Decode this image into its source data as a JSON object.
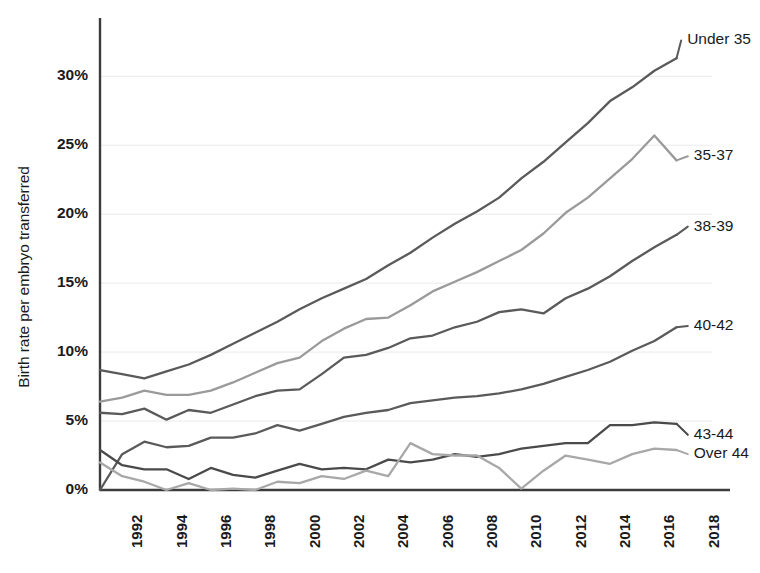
{
  "chart_data": {
    "type": "line",
    "title": "",
    "subtitle": "",
    "xlabel": "",
    "ylabel": "Birth rate per embryo transferred",
    "xlim": [
      1991,
      2018.6
    ],
    "ylim": [
      0,
      33.5
    ],
    "grid": "horizontal",
    "legend_position": "right-inline-labels",
    "x": [
      1991,
      1992,
      1993,
      1994,
      1995,
      1996,
      1997,
      1998,
      1999,
      2000,
      2001,
      2002,
      2003,
      2004,
      2005,
      2006,
      2007,
      2008,
      2009,
      2010,
      2011,
      2012,
      2013,
      2014,
      2015,
      2016,
      2017
    ],
    "x_tick_labels": [
      "1992",
      "1994",
      "1996",
      "1998",
      "2000",
      "2002",
      "2004",
      "2006",
      "2008",
      "2010",
      "2012",
      "2014",
      "2016",
      "2018"
    ],
    "x_tick_values": [
      1992,
      1994,
      1996,
      1998,
      2000,
      2002,
      2004,
      2006,
      2008,
      2010,
      2012,
      2014,
      2016,
      2018
    ],
    "y_tick_labels": [
      "0%",
      "5%",
      "10%",
      "15%",
      "20%",
      "25%",
      "30%"
    ],
    "y_tick_values": [
      0,
      5,
      10,
      15,
      20,
      25,
      30
    ],
    "series": [
      {
        "name": "Under 35",
        "color": "#5a5a5a",
        "label_x": 2017.3,
        "label_y": 32.6,
        "values": [
          8.7,
          8.4,
          8.1,
          8.6,
          9.1,
          9.8,
          10.6,
          11.4,
          12.2,
          13.1,
          13.9,
          14.6,
          15.3,
          16.3,
          17.2,
          18.3,
          19.3,
          20.2,
          21.2,
          22.6,
          23.8,
          25.2,
          26.6,
          28.2,
          29.2,
          30.4,
          31.3
        ]
      },
      {
        "name": "35-37",
        "color": "#9a9a9a",
        "label_x": 2017.6,
        "label_y": 24.2,
        "values": [
          6.4,
          6.7,
          7.2,
          6.9,
          6.9,
          7.2,
          7.8,
          8.5,
          9.2,
          9.6,
          10.8,
          11.7,
          12.4,
          12.5,
          13.4,
          14.4,
          15.1,
          15.8,
          16.6,
          17.4,
          18.6,
          20.1,
          21.2,
          22.6,
          24.0,
          25.7,
          23.9
        ]
      },
      {
        "name": "38-39",
        "color": "#5a5a5a",
        "label_x": 2017.6,
        "label_y": 19.1,
        "values": [
          5.6,
          5.5,
          5.9,
          5.1,
          5.8,
          5.6,
          6.2,
          6.8,
          7.2,
          7.3,
          8.4,
          9.6,
          9.8,
          10.3,
          11.0,
          11.2,
          11.8,
          12.2,
          12.9,
          13.1,
          12.8,
          13.9,
          14.6,
          15.5,
          16.6,
          17.6,
          18.5
        ]
      },
      {
        "name": "40-42",
        "color": "#5a5a5a",
        "label_x": 2017.6,
        "label_y": 11.9,
        "values": [
          0.0,
          2.6,
          3.5,
          3.1,
          3.2,
          3.8,
          3.8,
          4.1,
          4.7,
          4.3,
          4.8,
          5.3,
          5.6,
          5.8,
          6.3,
          6.5,
          6.7,
          6.8,
          7.0,
          7.3,
          7.7,
          8.2,
          8.7,
          9.3,
          10.1,
          10.8,
          11.8
        ]
      },
      {
        "name": "43-44",
        "color": "#4a4a4a",
        "label_x": 2017.6,
        "label_y": 4.0,
        "values": [
          2.9,
          1.8,
          1.5,
          1.5,
          0.8,
          1.6,
          1.1,
          0.9,
          1.4,
          1.9,
          1.5,
          1.6,
          1.5,
          2.2,
          2.0,
          2.2,
          2.6,
          2.4,
          2.6,
          3.0,
          3.2,
          3.4,
          3.4,
          4.7,
          4.7,
          4.9,
          4.8
        ]
      },
      {
        "name": "Over 44",
        "color": "#a8a8a8",
        "label_x": 2017.6,
        "label_y": 2.6,
        "values": [
          2.0,
          1.0,
          0.6,
          0.0,
          0.5,
          0.0,
          0.1,
          0.0,
          0.6,
          0.5,
          1.0,
          0.8,
          1.4,
          1.0,
          3.4,
          2.6,
          2.5,
          2.5,
          1.6,
          0.1,
          1.4,
          2.5,
          2.2,
          1.9,
          2.6,
          3.0,
          2.9
        ]
      }
    ]
  }
}
